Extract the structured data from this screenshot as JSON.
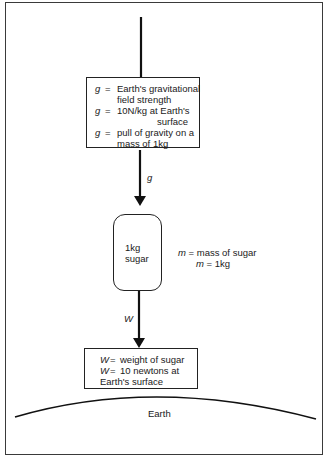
{
  "diagram": {
    "field_box": {
      "lines": [
        {
          "var": "g",
          "eq": "=",
          "text": "Earth's gravitational"
        },
        {
          "indent": "field strength"
        },
        {
          "var": "g",
          "eq": "=",
          "text": "10N/kg at Earth's"
        },
        {
          "indent_far": "surface"
        },
        {
          "var": "g",
          "eq": "=",
          "text": "pull of gravity on a"
        },
        {
          "indent": "mass of 1kg"
        }
      ]
    },
    "arrow_g_label": "g",
    "sugar_bag": {
      "line1": "1kg",
      "line2": "sugar"
    },
    "mass_note": {
      "line1_var": "m",
      "line1_text": " = mass of sugar",
      "line2_var": "m",
      "line2_text": " = 1kg"
    },
    "arrow_w_label": "W",
    "weight_box": {
      "lines": [
        {
          "var": "W",
          "eq": "=",
          "text": "weight of sugar"
        },
        {
          "var": "W",
          "eq": "=",
          "text": "10 newtons at"
        },
        {
          "text_only": "Earth's surface"
        }
      ]
    },
    "earth_label": "Earth",
    "colors": {
      "line": "#1a1a1a",
      "background": "#ffffff"
    }
  }
}
